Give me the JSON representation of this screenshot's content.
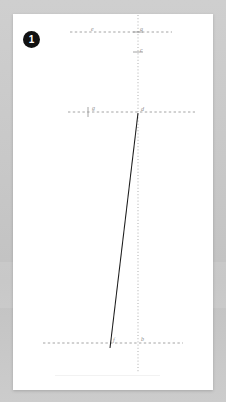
{
  "page": {
    "background_color": "#c9c9c9",
    "card_color": "#ffffff"
  },
  "badge": {
    "number": "1",
    "background_color": "#111111",
    "text_color": "#ffffff"
  },
  "figure": {
    "title": "",
    "stroke_color_solid": "#1a1a1a",
    "stroke_color_dashed": "#9a9a9a",
    "label_color": "#8d8d8d",
    "points": [
      {
        "id": "a",
        "label": "a",
        "x": 125,
        "y": 18,
        "label_x": 127,
        "label_y": 12
      },
      {
        "id": "c",
        "label": "c",
        "x": 125,
        "y": 38,
        "label_x": 127,
        "label_y": 32
      },
      {
        "id": "e",
        "label": "e",
        "x": 78,
        "y": 18,
        "label_x": 79,
        "label_y": 12
      },
      {
        "id": "g",
        "label": "g",
        "x": 75,
        "y": 98,
        "label_x": 79,
        "label_y": 92
      },
      {
        "id": "d",
        "label": "d",
        "x": 125,
        "y": 99,
        "label_x": 128,
        "label_y": 92
      },
      {
        "id": "f",
        "label": "f",
        "x": 97,
        "y": 330,
        "label_x": 100,
        "label_y": 324
      },
      {
        "id": "b",
        "label": "b",
        "x": 125,
        "y": 329,
        "label_x": 128,
        "label_y": 323
      }
    ],
    "dashed_horizontal_lines": [
      {
        "id": "line-e-a",
        "x1": 57,
        "x2": 159,
        "y": 18
      },
      {
        "id": "line-g-d",
        "x1": 55,
        "x2": 182,
        "y": 98
      },
      {
        "id": "line-f-b",
        "x1": 30,
        "x2": 170,
        "y": 329
      }
    ],
    "dotted_vertical_line": {
      "id": "axis-a-b",
      "x": 125,
      "y1": 1,
      "y2": 358
    },
    "solid_line": {
      "id": "segment-d-f",
      "x1": 125,
      "y1": 99,
      "x2": 97,
      "y2": 334
    },
    "tick_marks": [
      {
        "id": "tick-g",
        "x": 75,
        "y": 98,
        "orientation": "vertical"
      },
      {
        "id": "tick-c",
        "x": 125,
        "y": 38,
        "orientation": "horizontal"
      },
      {
        "id": "tick-a",
        "x": 125,
        "y": 18,
        "orientation": "horizontal"
      }
    ]
  }
}
